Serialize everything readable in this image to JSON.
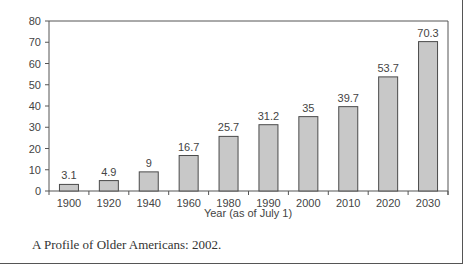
{
  "chart_data": {
    "type": "bar",
    "title": "",
    "xlabel": "Year (as of July 1)",
    "ylabel": "",
    "categories": [
      "1900",
      "1920",
      "1940",
      "1960",
      "1980",
      "1990",
      "2000",
      "2010",
      "2020",
      "2030"
    ],
    "values": [
      3.1,
      4.9,
      9,
      16.7,
      25.7,
      31.2,
      35,
      39.7,
      53.7,
      70.3
    ],
    "data_labels": [
      "3.1",
      "4.9",
      "9",
      "16.7",
      "25.7",
      "31.2",
      "35",
      "39.7",
      "53.7",
      "70.3"
    ],
    "ylim": [
      0,
      80
    ],
    "yticks": [
      0,
      10,
      20,
      30,
      40,
      50,
      60,
      70,
      80
    ],
    "grid": false,
    "legend": null,
    "bar_color": "#c8c8c8",
    "bar_edge_color": "#4a4a4a"
  },
  "caption": "A Profile of Older Americans: 2002."
}
